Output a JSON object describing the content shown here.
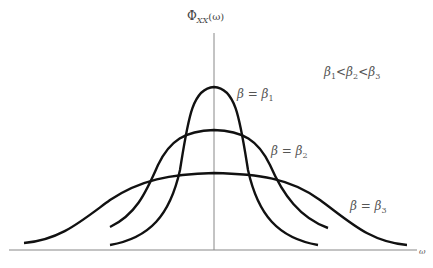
{
  "diagram": {
    "y_axis_label": {
      "main": "Φ",
      "sub": "XX",
      "arg": "(ω)"
    },
    "x_axis_label": "ω",
    "condition": {
      "b1": "β",
      "s1": "1",
      "lt1": "<",
      "b2": "β",
      "s2": "2",
      "lt2": "<",
      "b3": "β",
      "s3": "3"
    },
    "curves": [
      {
        "id": "beta1",
        "label": "β = β",
        "sub": "1",
        "peak": "narrowest, tallest"
      },
      {
        "id": "beta2",
        "label": "β = β",
        "sub": "2",
        "peak": "medium"
      },
      {
        "id": "beta3",
        "label": "β = β",
        "sub": "3",
        "peak": "widest, lowest"
      }
    ],
    "colors": {
      "curve": "#111111",
      "axis": "#888888",
      "text": "#555555"
    }
  }
}
